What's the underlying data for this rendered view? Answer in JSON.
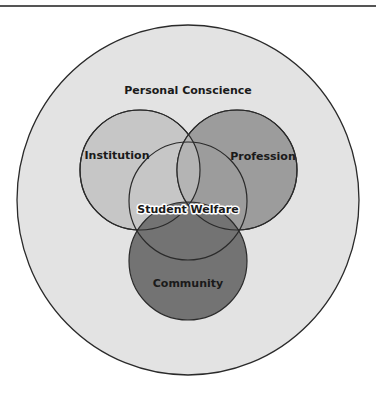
{
  "header": {
    "clipped_text": "..."
  },
  "diagram": {
    "type": "nested-venn",
    "outer": {
      "label": "Personal Conscience",
      "color": "#e3e3e3"
    },
    "circles": [
      {
        "label": "Institution",
        "color": "#c6c6c6"
      },
      {
        "label": "Profession",
        "color": "#9c9c9c"
      },
      {
        "label": "Community",
        "color": "#737373"
      }
    ],
    "center": {
      "label": "Student Welfare"
    },
    "stroke_color": "#2a2a2a"
  }
}
